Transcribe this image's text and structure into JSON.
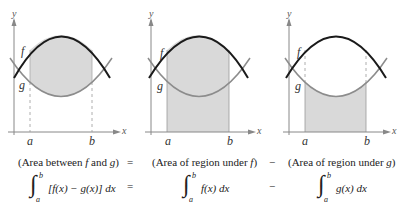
{
  "colors": {
    "curve_f": "#1a1a1a",
    "curve_g": "#8c8c8c",
    "shade": "#d9d9d9",
    "axis": "#888888",
    "background": "#ffffff"
  },
  "panels": [
    {
      "id": "area-between",
      "labels": {
        "y_axis": "y",
        "x_axis": "x",
        "f": "f",
        "g": "g",
        "a": "a",
        "b": "b"
      },
      "shaded_region": "between f and g",
      "caption": "(Area between f and g)",
      "formula": {
        "upper": "b",
        "lower": "a",
        "integrand": "[f(x) − g(x)] dx"
      }
    },
    {
      "id": "area-under-f",
      "labels": {
        "y_axis": "y",
        "x_axis": "x",
        "f": "f",
        "g": "g",
        "a": "a",
        "b": "b"
      },
      "shaded_region": "under f",
      "caption": "(Area of region under f)",
      "formula": {
        "upper": "b",
        "lower": "a",
        "integrand": "f(x) dx"
      }
    },
    {
      "id": "area-under-g",
      "labels": {
        "y_axis": "y",
        "x_axis": "x",
        "f": "f",
        "g": "g",
        "a": "a",
        "b": "b"
      },
      "shaded_region": "under g",
      "caption": "(Area of region under g)",
      "formula": {
        "upper": "b",
        "lower": "a",
        "integrand": "g(x) dx"
      }
    }
  ],
  "operators": {
    "caption_eq": "=",
    "caption_minus": "−",
    "formula_eq": "=",
    "formula_minus": "−"
  },
  "caption_parts": {
    "p1_pre": "(Area between ",
    "p1_f": "f",
    "p1_mid": " and ",
    "p1_g": "g",
    "p1_post": ")",
    "p2_pre": "(Area of region under ",
    "p2_f": "f",
    "p2_post": ")",
    "p3_pre": "(Area of region under ",
    "p3_g": "g",
    "p3_post": ")"
  },
  "integral_sign": "∫"
}
